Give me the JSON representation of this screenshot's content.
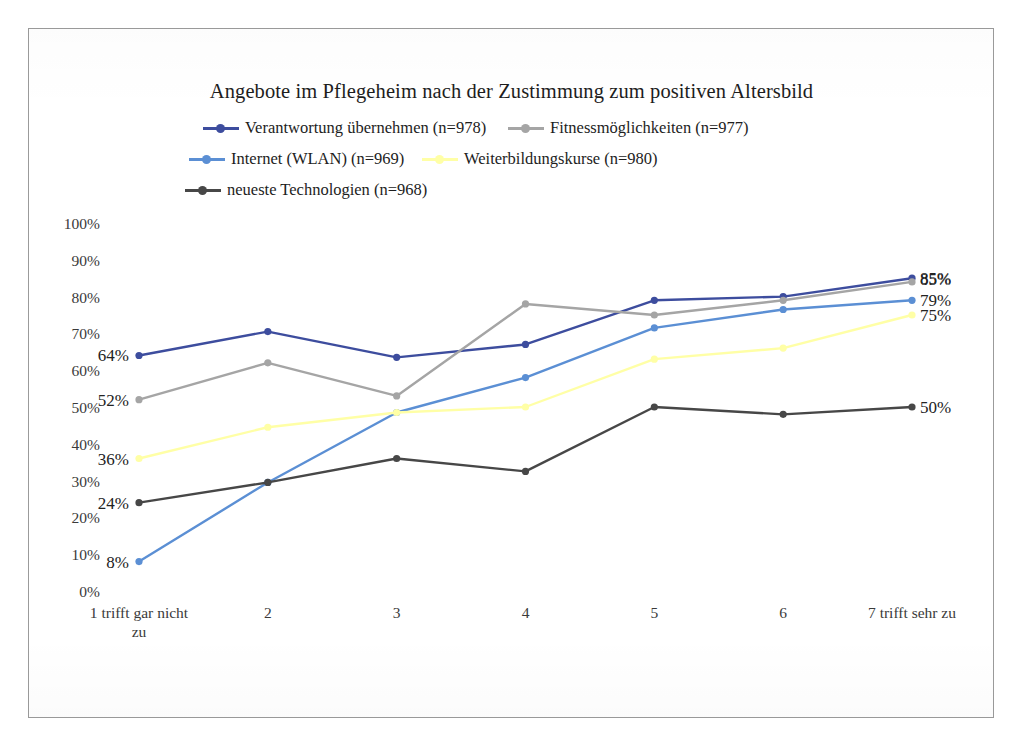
{
  "chart_data": {
    "type": "line",
    "title": "Angebote im Pflegeheim nach der Zustimmung zum positiven Altersbild",
    "xlabel": "",
    "ylabel": "",
    "ylim": [
      0,
      100
    ],
    "grid": false,
    "legend_position": "top",
    "y_ticks": [
      "100%",
      "90%",
      "80%",
      "70%",
      "60%",
      "50%",
      "40%",
      "30%",
      "20%",
      "10%",
      "0%"
    ],
    "y_tick_values": [
      100,
      90,
      80,
      70,
      60,
      50,
      40,
      30,
      20,
      10,
      0
    ],
    "categories": [
      "1 trifft gar nicht\nzu",
      "2",
      "3",
      "4",
      "5",
      "6",
      "7 trifft sehr zu"
    ],
    "series": [
      {
        "name": "Verantwortung übernehmen (n=978)",
        "color": "#3d4d9e",
        "values": [
          64,
          70.5,
          63.5,
          67,
          79,
          80,
          85
        ],
        "labels": [
          {
            "index": 0,
            "text": "64%",
            "side": "left"
          },
          {
            "index": 6,
            "text": "85%",
            "side": "right"
          }
        ]
      },
      {
        "name": "Fitnessmöglichkeiten (n=977)",
        "color": "#a5a5a5",
        "values": [
          52,
          62,
          53,
          78,
          75,
          79,
          84
        ],
        "labels": [
          {
            "index": 0,
            "text": "52%",
            "side": "left"
          }
        ]
      },
      {
        "name": "Internet (WLAN) (n=969)",
        "color": "#5b8fd4",
        "values": [
          8,
          29.5,
          48.5,
          58,
          71.5,
          76.5,
          79
        ],
        "labels": [
          {
            "index": 0,
            "text": "8%",
            "side": "left"
          },
          {
            "index": 6,
            "text": "79%",
            "side": "right"
          }
        ]
      },
      {
        "name": "Weiterbildungskurse (n=980)",
        "color": "#ffffa6",
        "values": [
          36,
          44.5,
          48.5,
          50,
          63,
          66,
          75
        ],
        "labels": [
          {
            "index": 0,
            "text": "36%",
            "side": "left"
          },
          {
            "index": 6,
            "text": "75%",
            "side": "right"
          }
        ]
      },
      {
        "name": "neueste Technologien  (n=968)",
        "color": "#474747",
        "values": [
          24,
          29.5,
          36,
          32.5,
          50,
          48,
          50
        ],
        "labels": [
          {
            "index": 0,
            "text": "24%",
            "side": "left"
          },
          {
            "index": 6,
            "text": "50%",
            "side": "right"
          }
        ]
      }
    ],
    "extra_labels": [
      {
        "text": "85%",
        "x": 920,
        "y": 271,
        "side": "right"
      }
    ]
  },
  "legend": {
    "items": [
      {
        "label": "Verantwortung übernehmen (n=978)",
        "color": "#3d4d9e",
        "slot": "r0c0"
      },
      {
        "label": "Fitnessmöglichkeiten (n=977)",
        "color": "#a5a5a5",
        "slot": "r0c1"
      },
      {
        "label": "Internet (WLAN) (n=969)",
        "color": "#5b8fd4",
        "slot": "r1c0"
      },
      {
        "label": "Weiterbildungskurse (n=980)",
        "color": "#ffffa6",
        "slot": "r1c1"
      },
      {
        "label": "neueste Technologien  (n=968)",
        "color": "#474747",
        "slot": "r2c0"
      }
    ]
  }
}
